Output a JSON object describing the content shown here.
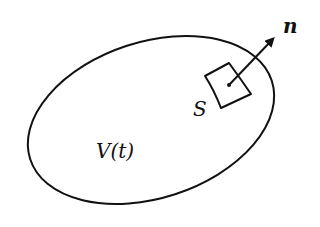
{
  "diagram": {
    "volume_label": "V(t)",
    "surface_label": "S",
    "normal_label": "n",
    "stroke_color": "#111111",
    "background_color": "#ffffff"
  }
}
